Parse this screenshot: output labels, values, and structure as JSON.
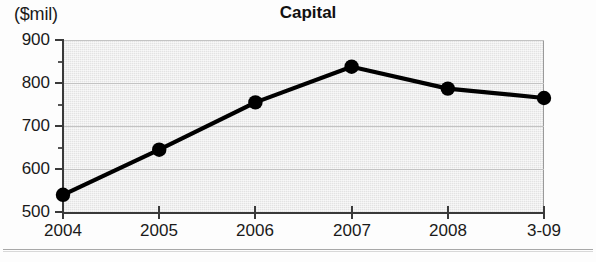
{
  "header": {
    "unit_label": "($mil)",
    "title": "Capital"
  },
  "chart_data": {
    "type": "line",
    "title": "Capital",
    "subtitle": "",
    "xlabel": "",
    "ylabel": "($mil)",
    "categories": [
      "2004",
      "2005",
      "2006",
      "2007",
      "2008",
      "3-09"
    ],
    "values": [
      540,
      645,
      755,
      838,
      787,
      765
    ],
    "series": [
      {
        "name": "Capital",
        "values": [
          540,
          645,
          755,
          838,
          787,
          765
        ]
      }
    ],
    "ylim": [
      500,
      900
    ],
    "ytick_labels": [
      "500",
      "600",
      "700",
      "800",
      "900"
    ],
    "ytick_values": [
      500,
      600,
      700,
      800,
      900
    ],
    "yminor_values": [
      550,
      650,
      750,
      850
    ],
    "grid": true,
    "legend": "none",
    "marker": "filled-circle",
    "line_color": "#000000",
    "marker_color": "#000000",
    "plot_background": "#e3e3e3"
  }
}
